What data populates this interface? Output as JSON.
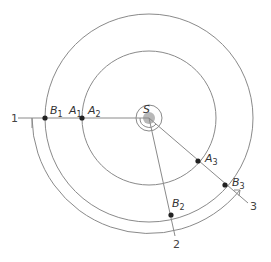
{
  "diagram": {
    "type": "orbital-geometry",
    "colors": {
      "line": "#8a8a8a",
      "point": "#222222",
      "sun": "#b8b8b8",
      "text": "#333333"
    },
    "sun": {
      "label": "S"
    },
    "orbits": [
      {
        "name": "inner-orbit",
        "planet": "A"
      },
      {
        "name": "outer-orbit",
        "planet": "B"
      }
    ],
    "lines": [
      {
        "label": "1"
      },
      {
        "label": "2"
      },
      {
        "label": "3"
      }
    ],
    "points": {
      "A1": {
        "base": "A",
        "sub": "1"
      },
      "A2": {
        "base": "A",
        "sub": "2"
      },
      "A3": {
        "base": "A",
        "sub": "3"
      },
      "B1": {
        "base": "B",
        "sub": "1"
      },
      "B2": {
        "base": "B",
        "sub": "2"
      },
      "B3": {
        "base": "B",
        "sub": "3"
      }
    }
  }
}
